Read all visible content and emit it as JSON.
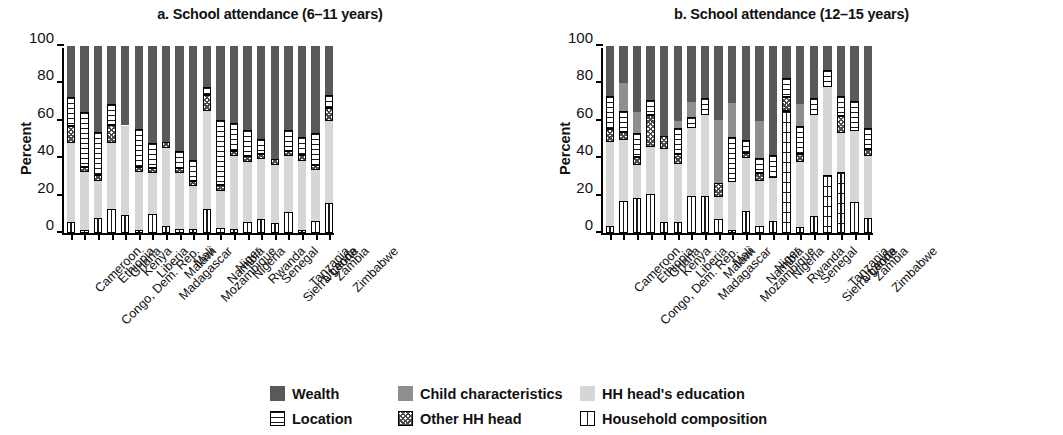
{
  "figure": {
    "ylabel": "Percent",
    "yticks": [
      0,
      20,
      40,
      60,
      80,
      100
    ]
  },
  "legend": {
    "rows": [
      [
        {
          "key": "wealth",
          "label": "Wealth",
          "swatch": "solid-dark-gray",
          "color": "#58595b"
        },
        {
          "key": "child",
          "label": "Child characteristics",
          "swatch": "solid-medium-gray",
          "color": "#8d8e90"
        },
        {
          "key": "hhedu",
          "label": "HH head's education",
          "swatch": "solid-light-gray",
          "color": "#d6d6d4"
        }
      ],
      [
        {
          "key": "location",
          "label": "Location",
          "swatch": "horizontal-lines",
          "color": "#ffffff"
        },
        {
          "key": "otherhh",
          "label": "Other HH head",
          "swatch": "checkerboard",
          "color": "#ffffff"
        },
        {
          "key": "hhcomp",
          "label": "Household composition",
          "swatch": "vertical-split-box",
          "color": "#ffffff"
        }
      ]
    ]
  },
  "chart_data": [
    {
      "id": "a",
      "type": "bar",
      "stacked": true,
      "title": "a. School attendance (6–11 years)",
      "xlabel": "",
      "ylabel": "Percent",
      "ylim": [
        0,
        100
      ],
      "grid": false,
      "legend_position": "bottom",
      "categories": [
        "Cameroon",
        "Congo, Dem. Rep.",
        "Ethiopia",
        "Ghana",
        "Kenya",
        "Liberia",
        "Madagascar",
        "Malawi",
        "Mali",
        "Mozambique",
        "Namibia",
        "Niger",
        "Nigeria",
        "Rwanda",
        "Senegal",
        "Sierra Leone",
        "Tanzania",
        "Uganda",
        "Zambia",
        "Zimbabwe"
      ],
      "series": [
        {
          "name": "Household composition",
          "key": "hhcomp",
          "values": [
            6,
            1.5,
            8,
            13,
            9.5,
            1.5,
            10,
            3.5,
            2,
            2,
            13,
            2.5,
            2,
            6,
            7.5,
            5.5,
            11,
            1.5,
            6.5,
            16
          ]
        },
        {
          "name": "HH head's education",
          "key": "hhedu",
          "values": [
            42,
            31,
            20,
            35,
            48,
            31,
            22,
            42,
            30,
            23,
            52,
            20,
            39,
            32,
            32,
            31,
            30,
            37,
            27,
            44
          ]
        },
        {
          "name": "Other HH head",
          "key": "otherhh",
          "values": [
            9,
            3,
            3,
            10,
            0,
            3,
            3,
            3,
            3,
            3,
            9,
            3,
            3,
            3,
            3,
            3,
            3,
            3,
            3,
            7
          ]
        },
        {
          "name": "Location",
          "key": "location",
          "values": [
            16,
            29,
            23,
            11,
            0,
            20,
            13,
            0,
            9,
            11,
            4,
            35,
            15,
            14,
            8,
            0,
            11,
            10,
            17,
            7
          ]
        },
        {
          "name": "Child characteristics",
          "key": "child",
          "values": [
            0,
            0,
            0,
            0,
            0,
            0,
            0,
            0,
            0,
            0,
            0,
            0,
            0,
            0,
            0,
            0,
            0,
            0,
            0,
            0
          ]
        },
        {
          "name": "Wealth",
          "key": "wealth",
          "values": [
            27,
            35.5,
            46,
            31,
            42.5,
            44.5,
            52,
            51.5,
            56,
            61,
            22,
            39.5,
            41,
            45,
            49.5,
            60.5,
            45,
            48.5,
            46.5,
            26
          ]
        }
      ]
    },
    {
      "id": "b",
      "type": "bar",
      "stacked": true,
      "title": "b. School attendance (12–15 years)",
      "xlabel": "",
      "ylabel": "Percent",
      "ylim": [
        0,
        100
      ],
      "grid": false,
      "legend_position": "bottom",
      "categories": [
        "Cameroon",
        "Congo, Dem. Rep.",
        "Ethiopia",
        "Ghana",
        "Kenya",
        "Liberia",
        "Madagascar",
        "Malawi",
        "Mali",
        "Mozambique",
        "Namibia",
        "Niger",
        "Nigeria",
        "Rwanda",
        "Senegal",
        "Sierra Leone",
        "Tanzania",
        "Uganda",
        "Zambia",
        "Zimbabwe"
      ],
      "series": [
        {
          "name": "Household composition",
          "key": "hhcomp",
          "values": [
            3.5,
            17,
            18.5,
            21,
            6,
            6,
            20,
            20,
            7.5,
            1.5,
            12,
            4,
            6.5,
            65,
            3,
            9,
            31,
            32.5,
            16.5,
            8
          ]
        },
        {
          "name": "HH head's education",
          "key": "hhedu",
          "values": [
            45,
            33,
            18,
            25,
            39,
            31,
            36,
            43,
            12,
            26,
            28,
            24,
            23,
            0,
            35,
            54,
            47,
            21,
            38,
            33
          ]
        },
        {
          "name": "Other HH head",
          "key": "otherhh",
          "values": [
            7,
            4,
            4,
            17,
            7,
            5,
            0,
            0,
            7,
            0,
            3,
            4,
            0,
            8,
            4,
            0,
            0,
            9,
            0,
            4
          ]
        },
        {
          "name": "Location",
          "key": "location",
          "values": [
            18,
            11,
            13,
            8,
            0,
            14,
            6,
            9,
            0,
            24,
            7,
            8,
            12,
            10,
            15,
            9,
            9,
            11,
            16,
            11
          ]
        },
        {
          "name": "Child characteristics",
          "key": "child",
          "values": [
            0,
            15,
            11,
            0,
            0,
            4,
            8,
            0,
            34,
            18,
            0,
            20,
            0,
            0,
            12,
            0,
            0,
            0,
            0,
            0
          ]
        },
        {
          "name": "Wealth",
          "key": "wealth",
          "values": [
            26.5,
            20,
            35.5,
            29,
            48,
            40,
            30,
            28,
            39.5,
            30.5,
            50,
            40,
            58.5,
            17,
            31,
            28,
            13,
            26.5,
            29.5,
            44
          ]
        }
      ]
    }
  ]
}
